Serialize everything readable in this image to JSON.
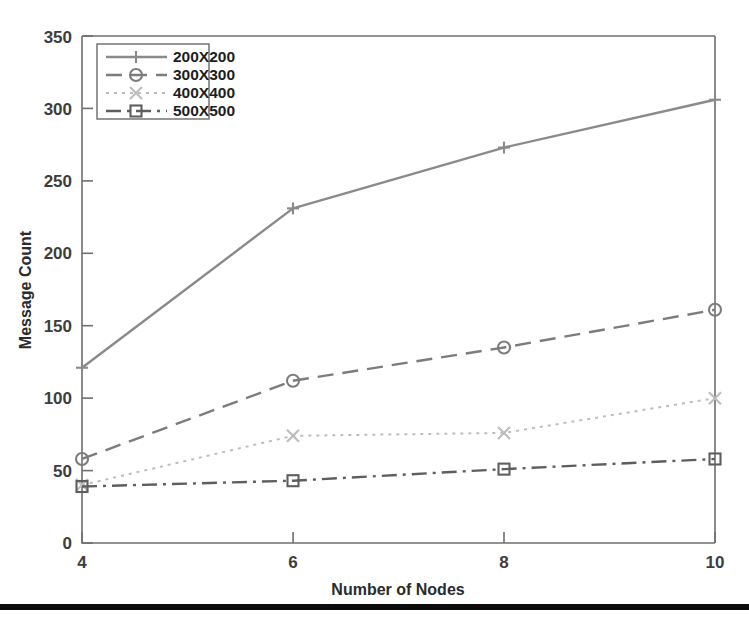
{
  "chart_data": {
    "type": "line",
    "title": "",
    "xlabel": "Number of Nodes",
    "ylabel": "Message Count",
    "x": [
      4,
      6,
      8,
      10
    ],
    "xticklabels": [
      "4",
      "6",
      "8",
      "10"
    ],
    "yticklabels": [
      "0",
      "50",
      "100",
      "150",
      "200",
      "250",
      "300",
      "350"
    ],
    "yticks": [
      0,
      50,
      100,
      150,
      200,
      250,
      300,
      350
    ],
    "xlim": [
      4,
      10
    ],
    "ylim": [
      0,
      350
    ],
    "grid": false,
    "legend_position": "upper-left-inside",
    "series": [
      {
        "name": "200X200",
        "values": [
          121,
          231,
          273,
          306
        ],
        "marker": "plus",
        "linestyle": "solid",
        "color": "#8a8a8a"
      },
      {
        "name": "300X300",
        "values": [
          58,
          112,
          135,
          161
        ],
        "marker": "circle",
        "linestyle": "dashed",
        "color": "#7c7c7c"
      },
      {
        "name": "400X400",
        "values": [
          40,
          74,
          76,
          100
        ],
        "marker": "x",
        "linestyle": "dotted",
        "color": "#bdbdbd"
      },
      {
        "name": "500X500",
        "values": [
          39,
          43,
          51,
          58
        ],
        "marker": "square",
        "linestyle": "dashdot",
        "color": "#5e5e5e"
      }
    ]
  },
  "axes": {
    "y_title": "Message Count",
    "x_title": "Number of Nodes",
    "y_tick_0": "0",
    "y_tick_50": "50",
    "y_tick_100": "100",
    "y_tick_150": "150",
    "y_tick_200": "200",
    "y_tick_250": "250",
    "y_tick_300": "300",
    "y_tick_350": "350",
    "x_tick_4": "4",
    "x_tick_6": "6",
    "x_tick_8": "8",
    "x_tick_10": "10"
  },
  "legend": {
    "entry_0": "200X200",
    "entry_1": "300X300",
    "entry_2": "400X400",
    "entry_3": "500X500"
  },
  "colors": {
    "axis": "#6f6f6f",
    "series_200": "#8a8a8a",
    "series_300": "#7c7c7c",
    "series_400": "#bdbdbd",
    "series_500": "#5e5e5e",
    "page_rule": "#0b0b0b"
  }
}
